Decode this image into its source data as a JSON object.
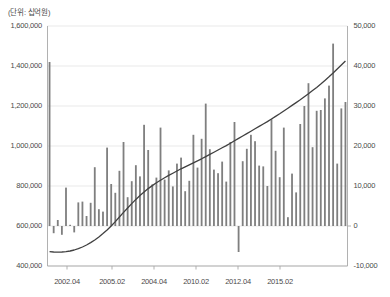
{
  "unit_note": "(단위: 십억원)",
  "axes": {
    "left": {
      "ticks": [
        "1,600,000",
        "1,400,000",
        "1,200,000",
        "1,000,000",
        "800,000",
        "600,000",
        "400,000"
      ],
      "min": 400000,
      "max": 1600000,
      "step": 200000
    },
    "right": {
      "ticks": [
        "50,000",
        "40,000",
        "30,000",
        "20,000",
        "10,000",
        "0",
        "-10,000"
      ],
      "min": -10000,
      "max": 50000,
      "step": 10000
    },
    "x": {
      "ticks": [
        "2002.04",
        "2005.02",
        "2004.04",
        "2010.02",
        "2012.04",
        "2015.02"
      ],
      "tick_positions": [
        0.065,
        0.215,
        0.355,
        0.495,
        0.635,
        0.775
      ]
    }
  },
  "colors": {
    "bar": "#7f7f7f",
    "line": "#404040",
    "grid": "#e3e3e3",
    "axis": "#a8a8a8",
    "text": "#4a4a4a"
  },
  "chart_data": {
    "type": "bar",
    "title": "",
    "subtitle": "",
    "xlabel": "",
    "ylabel": "",
    "unit": "(단위: 십억원)",
    "grid": true,
    "legend": "none",
    "ylim": [
      400000,
      1600000
    ],
    "y2lim": [
      -10000,
      50000
    ],
    "xtick_labels": [
      "2002.04",
      "2005.02",
      "2004.04",
      "2010.02",
      "2012.04",
      "2015.02"
    ],
    "series": [
      {
        "name": "bars",
        "type": "bar",
        "axis": "right",
        "values": [
          41000,
          -1800,
          1500,
          -2200,
          9600,
          300,
          -1600,
          5900,
          6100,
          2500,
          5800,
          14700,
          4200,
          3600,
          19600,
          10500,
          8300,
          13800,
          21000,
          7200,
          11200,
          15200,
          12400,
          25300,
          19000,
          10400,
          12100,
          24600,
          11600,
          13900,
          9900,
          15600,
          17100,
          8700,
          11300,
          22800,
          14600,
          21800,
          30600,
          19200,
          14100,
          13200,
          16100,
          11100,
          21000,
          26000,
          -6500,
          16200,
          19300,
          22800,
          21200,
          15100,
          14900,
          10000,
          26700,
          18800,
          12200,
          24600,
          2200,
          13100,
          8400,
          25500,
          30000,
          35700,
          19700,
          28800,
          29000,
          31900,
          35100,
          45600,
          15600,
          29400,
          31000
        ]
      },
      {
        "name": "line",
        "type": "line",
        "axis": "left",
        "values": [
          472000,
          470000,
          469000,
          470000,
          472000,
          475000,
          480000,
          487000,
          495000,
          505000,
          517000,
          530000,
          545000,
          562000,
          580000,
          600000,
          622000,
          645000,
          668000,
          690000,
          712000,
          733000,
          752000,
          770000,
          787000,
          802000,
          816000,
          829000,
          841000,
          853000,
          864000,
          875000,
          886000,
          896000,
          906000,
          916000,
          926000,
          936000,
          947000,
          958000,
          969000,
          980000,
          991000,
          1002000,
          1014000,
          1026000,
          1038000,
          1050000,
          1062000,
          1074000,
          1086000,
          1098000,
          1110000,
          1122000,
          1135000,
          1148000,
          1161000,
          1175000,
          1189000,
          1203000,
          1217000,
          1231000,
          1246000,
          1261000,
          1277000,
          1293000,
          1310000,
          1328000,
          1346000,
          1365000,
          1385000,
          1405000,
          1425000
        ]
      }
    ]
  }
}
